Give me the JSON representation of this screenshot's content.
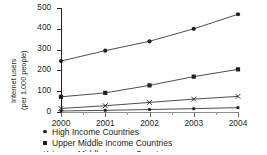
{
  "chart_data": {
    "type": "line",
    "title": "",
    "xlabel": "",
    "ylabel": "Internet users\n(per 1,000 people)",
    "ylabel_line1": "Internet users",
    "ylabel_line2": "(per 1,000 people)",
    "categories": [
      "2000",
      "2001",
      "2002",
      "2003",
      "2004"
    ],
    "x": [
      2000,
      2001,
      2002,
      2003,
      2004
    ],
    "xlim": [
      2000,
      2004
    ],
    "ylim": [
      0,
      500
    ],
    "yticks": [
      0,
      100,
      200,
      300,
      400,
      500
    ],
    "ytick_labels": [
      "0",
      "100",
      "200",
      "300",
      "400",
      "500"
    ],
    "xtick_labels": [
      "2000",
      "2001",
      "2002",
      "2003",
      "2004"
    ],
    "grid": false,
    "legend_position": "below-left",
    "series": [
      {
        "name": "High Income Countries",
        "marker": "circle",
        "values": [
          245,
          295,
          340,
          400,
          470
        ]
      },
      {
        "name": "Upper Middle Income Countries",
        "marker": "square",
        "values": [
          73,
          92,
          128,
          170,
          205
        ]
      },
      {
        "name": "Lower Middle Income Countries",
        "marker": "x",
        "values": [
          17,
          30,
          46,
          62,
          75
        ]
      },
      {
        "name": "Low Income Countries",
        "marker": "square-small",
        "values": [
          5,
          8,
          12,
          16,
          21
        ]
      }
    ]
  },
  "legend": {
    "items": [
      {
        "label": "High Income Countries",
        "marker": "circle-marker-icon"
      },
      {
        "label": "Upper Middle Income Countries",
        "marker": "square-marker-icon"
      },
      {
        "label": "Lower Middle Income Countries",
        "marker": "x-marker-icon"
      }
    ]
  },
  "colors": {
    "ink": "#231f20",
    "axis_bottom": "#8e8e8e",
    "series": "#231f20",
    "background": "#ffffff"
  }
}
